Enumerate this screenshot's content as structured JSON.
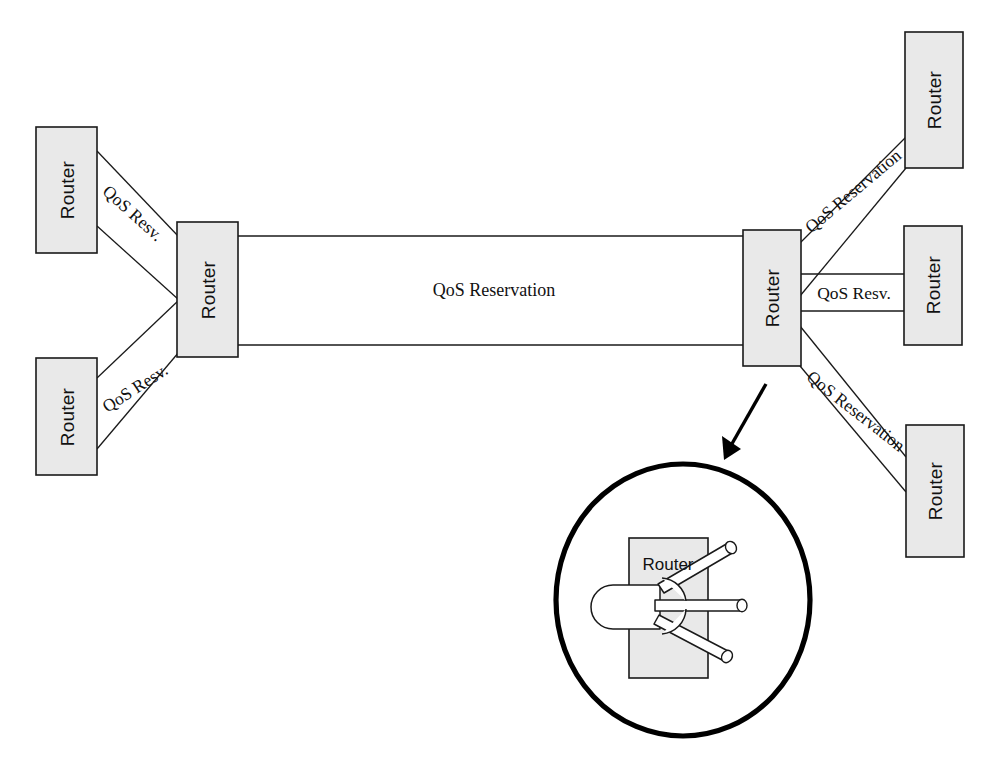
{
  "diagram": {
    "colors": {
      "router_fill": "#e9e9e9",
      "stroke": "#1a1a1a",
      "background": "#ffffff",
      "magnifier_stroke": "#000000"
    },
    "routers": [
      {
        "id": "left-top",
        "label": "Router",
        "orientation": "vertical"
      },
      {
        "id": "left-bottom",
        "label": "Router",
        "orientation": "vertical"
      },
      {
        "id": "hub-left",
        "label": "Router",
        "orientation": "vertical"
      },
      {
        "id": "hub-right",
        "label": "Router",
        "orientation": "vertical"
      },
      {
        "id": "right-top",
        "label": "Router",
        "orientation": "vertical"
      },
      {
        "id": "right-middle",
        "label": "Router",
        "orientation": "vertical"
      },
      {
        "id": "right-bottom",
        "label": "Router",
        "orientation": "vertical"
      },
      {
        "id": "magnified",
        "label": "Router",
        "orientation": "horizontal"
      }
    ],
    "links": [
      {
        "id": "left-top-to-hub",
        "label": "QoS Resv.",
        "from": "left-top",
        "to": "hub-left"
      },
      {
        "id": "left-bottom-to-hub",
        "label": "QoS Resv.",
        "from": "left-bottom",
        "to": "hub-left"
      },
      {
        "id": "trunk",
        "label": "QoS Reservation",
        "from": "hub-left",
        "to": "hub-right"
      },
      {
        "id": "hub-to-right-top",
        "label": "QoS Reservation",
        "from": "hub-right",
        "to": "right-top"
      },
      {
        "id": "hub-to-right-middle",
        "label": "QoS Resv.",
        "from": "hub-right",
        "to": "right-middle"
      },
      {
        "id": "hub-to-right-bottom",
        "label": "QoS Reservation",
        "from": "hub-right",
        "to": "right-bottom"
      }
    ],
    "magnifier": {
      "caption": "Router",
      "incoming_pipes": 1,
      "outgoing_pipes": 3,
      "describes": "hub-right"
    }
  }
}
